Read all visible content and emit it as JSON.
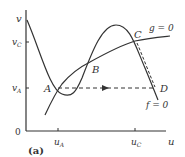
{
  "figure": {
    "panel_label": "(a)",
    "axes": {
      "x_label": "u",
      "y_label": "v",
      "origin_label": "0",
      "x_ticks": [
        "u_A",
        "u_C"
      ],
      "y_ticks": [
        "v_C",
        "v_A"
      ]
    },
    "curves": [
      {
        "name": "f-nullcline",
        "label": "f = 0",
        "shape": "cubic"
      },
      {
        "name": "g-nullcline",
        "label": "g = 0",
        "shape": "increasing"
      }
    ],
    "points": [
      {
        "label": "A",
        "u": "u_A",
        "v": "v_A"
      },
      {
        "label": "B"
      },
      {
        "label": "C",
        "u": "u_C",
        "v": "v_C"
      },
      {
        "label": "D",
        "v": "v_A"
      }
    ],
    "trajectory": {
      "segments": [
        "A to D (dashed, arrow right)",
        "C to D (dashed, along f=0)"
      ]
    },
    "colors": {
      "line": "#333333",
      "background": "#ffffff"
    }
  },
  "text": {
    "v": "v",
    "vC_main": "v",
    "vC_sub": "C",
    "vA_main": "v",
    "vA_sub": "A",
    "zero": "0",
    "uA_main": "u",
    "uA_sub": "A",
    "uC_main": "u",
    "uC_sub": "C",
    "u": "u",
    "A": "A",
    "B": "B",
    "C": "C",
    "D": "D",
    "g0": "g = 0",
    "f0": "f = 0",
    "panel": "(a)"
  }
}
